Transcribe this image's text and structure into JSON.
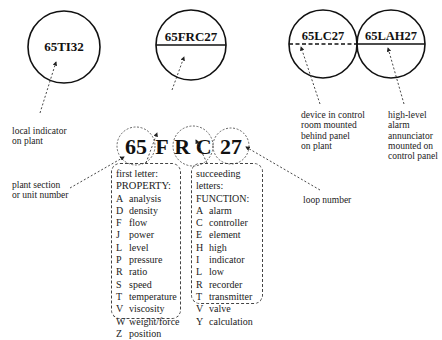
{
  "symbols": [
    {
      "tag": "65TI32",
      "style": "plain",
      "caption": [
        "local indicator",
        "on plant"
      ]
    },
    {
      "tag": "65FRC27",
      "style": "solid-line",
      "caption": []
    },
    {
      "tag": "65LC27",
      "style": "dashed-line",
      "caption": [
        "device in control",
        "room mounted",
        "behind panel",
        "on plant"
      ]
    },
    {
      "tag": "65LAH27",
      "style": "solid-line",
      "caption": [
        "high-level",
        "alarm",
        "annunciator",
        "mounted on",
        "control panel"
      ]
    }
  ],
  "breakdown": {
    "unit": "65",
    "first_letter": "F",
    "succeeding": "R C",
    "loop": "27"
  },
  "annotations": {
    "unit_label": [
      "plant section",
      "or unit number"
    ],
    "loop_label": "loop number"
  },
  "property_box": {
    "heading": [
      "first letter:",
      "PROPERTY:"
    ],
    "items": [
      {
        "code": "A",
        "name": "analysis"
      },
      {
        "code": "D",
        "name": "density"
      },
      {
        "code": "F",
        "name": "flow"
      },
      {
        "code": "J",
        "name": "power"
      },
      {
        "code": "L",
        "name": "level"
      },
      {
        "code": "P",
        "name": "pressure"
      },
      {
        "code": "R",
        "name": "ratio"
      },
      {
        "code": "S",
        "name": "speed"
      },
      {
        "code": "T",
        "name": "temperature"
      },
      {
        "code": "V",
        "name": "viscosity"
      },
      {
        "code": "W",
        "name": "weight/force"
      },
      {
        "code": "Z",
        "name": "position"
      }
    ]
  },
  "function_box": {
    "heading": [
      "succeeding",
      "letters:",
      "FUNCTION:"
    ],
    "items": [
      {
        "code": "A",
        "name": "alarm"
      },
      {
        "code": "C",
        "name": "controller"
      },
      {
        "code": "E",
        "name": "element"
      },
      {
        "code": "H",
        "name": "high"
      },
      {
        "code": "I",
        "name": "indicator"
      },
      {
        "code": "L",
        "name": "low"
      },
      {
        "code": "R",
        "name": "recorder"
      },
      {
        "code": "T",
        "name": "transmitter"
      },
      {
        "code": "V",
        "name": "valve"
      },
      {
        "code": "Y",
        "name": "calculation"
      }
    ]
  }
}
